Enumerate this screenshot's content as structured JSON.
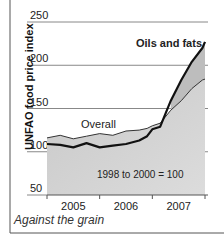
{
  "chart_data": {
    "type": "area",
    "title": "",
    "caption": "Against the grain",
    "xlabel": "",
    "ylabel": "UNFAO food price index",
    "ylim": [
      50,
      250
    ],
    "yticks": [
      50,
      100,
      150,
      200,
      250
    ],
    "xticks": [
      "2005",
      "2006",
      "2007"
    ],
    "grid": true,
    "note": "1998 to 2000 = 100",
    "x": [
      2005.0,
      2005.25,
      2005.5,
      2005.75,
      2006.0,
      2006.25,
      2006.5,
      2006.75,
      2006.9,
      2007.0,
      2007.15,
      2007.35,
      2007.55,
      2007.75,
      2007.95,
      2008.0
    ],
    "series": [
      {
        "name": "Oils and fats",
        "style": "thick-dark-line",
        "values": [
          109,
          108,
          105,
          110,
          105,
          107,
          109,
          113,
          118,
          126,
          129,
          159,
          183,
          204,
          220,
          227
        ]
      },
      {
        "name": "Overall",
        "style": "thin-line-shaded-area",
        "values": [
          116,
          119,
          115,
          118,
          121,
          119,
          124,
          125,
          127,
          130,
          133,
          148,
          159,
          173,
          183,
          184
        ]
      }
    ]
  }
}
